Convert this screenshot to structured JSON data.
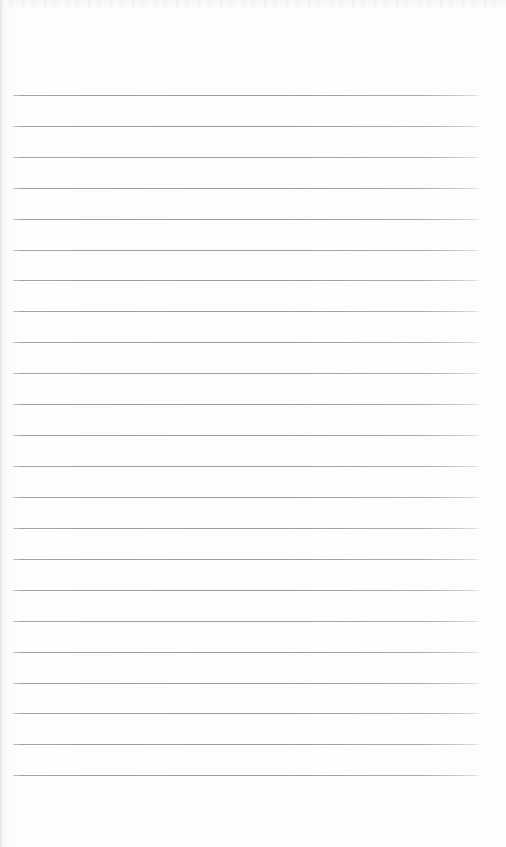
{
  "document": {
    "kind": "ruled-notebook-page",
    "title": "Blank lined page",
    "orientation": "portrait",
    "page_width": 506,
    "page_height": 847,
    "background_color": "#fdfdfd",
    "has_written_content": false,
    "header_text": "",
    "footer_text": "",
    "page_number_text": ""
  },
  "ruling": {
    "line_color": "#9d9da0",
    "line_thickness": 1,
    "line_count": 23,
    "line_left": 13,
    "line_right": 478,
    "line_width": 465,
    "first_line_y": 95,
    "line_spacing": 30.9,
    "margin_line_visible": false,
    "top_margin": 95,
    "bottom_margin": 72,
    "lines_y": [
      95,
      126,
      157,
      188,
      219,
      250,
      280,
      311,
      342,
      373,
      404,
      435,
      466,
      497,
      528,
      559,
      590,
      621,
      652,
      683,
      713,
      744,
      775
    ]
  },
  "artifacts": {
    "top_scan_band_color": "#eeeef0",
    "left_edge_shadow_color": "#e4e4e7"
  }
}
